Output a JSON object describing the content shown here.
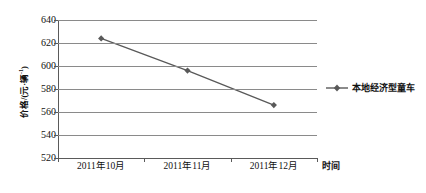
{
  "chart_data": {
    "type": "line",
    "title": "",
    "subtitle": "",
    "xlabel": "时间",
    "ylabel": "价格/(元·辆-1)",
    "ylabel_main": "价格/(元·辆",
    "ylabel_sup": "-1",
    "ylabel_tail": ")",
    "categories": [
      "2011年10月",
      "2011年11月",
      "2011年12月"
    ],
    "yticks": [
      640,
      620,
      600,
      580,
      560,
      540,
      520
    ],
    "ylim": [
      520,
      640
    ],
    "grid": true,
    "legend_position": "right",
    "series": [
      {
        "name": "本地经济型童车",
        "color": "#595959",
        "marker": "diamond",
        "values": [
          624,
          596,
          566
        ]
      }
    ]
  },
  "legend": {
    "entries": [
      {
        "label": "本地经济型童车"
      }
    ]
  },
  "axes": {
    "x_title": "时间",
    "y_title_main": "价格/(元·辆",
    "y_title_sup": "-1",
    "y_title_tail": ")"
  }
}
